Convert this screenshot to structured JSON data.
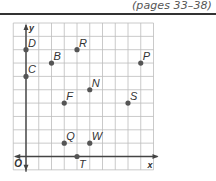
{
  "header": {
    "page_ref": "(pages 33–38)"
  },
  "colors": {
    "grid": "#bdbdbd",
    "axis": "#444444",
    "point": "#555555",
    "text": "#333333"
  },
  "chart_data": {
    "type": "scatter",
    "title": "",
    "xlabel": "x",
    "ylabel": "y",
    "origin_label": "O",
    "xlim": [
      -1,
      10
    ],
    "ylim": [
      -1,
      10
    ],
    "grid": true,
    "points": [
      {
        "label": "D",
        "x": 0,
        "y": 8
      },
      {
        "label": "R",
        "x": 4,
        "y": 8
      },
      {
        "label": "B",
        "x": 2,
        "y": 7
      },
      {
        "label": "P",
        "x": 9,
        "y": 7
      },
      {
        "label": "C",
        "x": 0,
        "y": 6
      },
      {
        "label": "N",
        "x": 5,
        "y": 5
      },
      {
        "label": "F",
        "x": 3,
        "y": 4
      },
      {
        "label": "S",
        "x": 8,
        "y": 4
      },
      {
        "label": "Q",
        "x": 3,
        "y": 1
      },
      {
        "label": "W",
        "x": 5,
        "y": 1
      },
      {
        "label": "T",
        "x": 4,
        "y": 0
      }
    ]
  }
}
